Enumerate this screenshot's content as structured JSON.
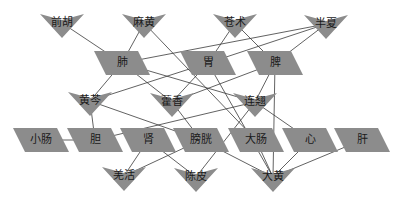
{
  "diagram": {
    "title": "",
    "node_fill": "#8c8c8c",
    "edge_color": "#3a3a3a",
    "herbs": [
      {
        "id": "qianhu",
        "label": "前胡",
        "x": 62,
        "y": 23
      },
      {
        "id": "mahuang",
        "label": "麻黄",
        "x": 144,
        "y": 23
      },
      {
        "id": "cangzhu",
        "label": "苍术",
        "x": 235,
        "y": 23
      },
      {
        "id": "banxia",
        "label": "半夏",
        "x": 326,
        "y": 24
      },
      {
        "id": "huangqin",
        "label": "黄芩",
        "x": 90,
        "y": 101
      },
      {
        "id": "huoxiang",
        "label": "藿香",
        "x": 172,
        "y": 102
      },
      {
        "id": "lianqiao",
        "label": "连翘",
        "x": 255,
        "y": 102
      },
      {
        "id": "qianghuo",
        "label": "羌活",
        "x": 124,
        "y": 176
      },
      {
        "id": "chenpi",
        "label": "陈皮",
        "x": 196,
        "y": 177
      },
      {
        "id": "dahuang",
        "label": "大黄",
        "x": 273,
        "y": 177
      }
    ],
    "organs": [
      {
        "id": "fei",
        "label": "肺",
        "x": 122,
        "y": 63
      },
      {
        "id": "wei",
        "label": "胃",
        "x": 208,
        "y": 63
      },
      {
        "id": "pi",
        "label": "脾",
        "x": 275,
        "y": 63
      },
      {
        "id": "xiaochang",
        "label": "小肠",
        "x": 41,
        "y": 140
      },
      {
        "id": "dan",
        "label": "胆",
        "x": 95,
        "y": 140
      },
      {
        "id": "shen",
        "label": "肾",
        "x": 148,
        "y": 140
      },
      {
        "id": "pangguang",
        "label": "膀胱",
        "x": 201,
        "y": 140
      },
      {
        "id": "dachang",
        "label": "大肠",
        "x": 256,
        "y": 140
      },
      {
        "id": "xin",
        "label": "心",
        "x": 310,
        "y": 140
      },
      {
        "id": "gan",
        "label": "肝",
        "x": 362,
        "y": 140
      }
    ],
    "edges": [
      [
        "qianhu",
        "fei"
      ],
      [
        "mahuang",
        "fei"
      ],
      [
        "mahuang",
        "dachang"
      ],
      [
        "cangzhu",
        "wei"
      ],
      [
        "cangzhu",
        "pi"
      ],
      [
        "banxia",
        "fei"
      ],
      [
        "banxia",
        "wei"
      ],
      [
        "banxia",
        "pi"
      ],
      [
        "fei",
        "huangqin"
      ],
      [
        "fei",
        "huoxiang"
      ],
      [
        "fei",
        "lianqiao"
      ],
      [
        "wei",
        "huangqin"
      ],
      [
        "wei",
        "huoxiang"
      ],
      [
        "wei",
        "dahuang"
      ],
      [
        "pi",
        "huoxiang"
      ],
      [
        "pi",
        "lianqiao"
      ],
      [
        "pi",
        "dahuang"
      ],
      [
        "huangqin",
        "dan"
      ],
      [
        "huangqin",
        "pangguang"
      ],
      [
        "huoxiang",
        "pangguang"
      ],
      [
        "lianqiao",
        "dan"
      ],
      [
        "lianqiao",
        "xin"
      ],
      [
        "lianqiao",
        "chenpi"
      ],
      [
        "xiaochang",
        "dan"
      ],
      [
        "shen",
        "qianghuo"
      ],
      [
        "shen",
        "chenpi"
      ],
      [
        "pangguang",
        "qianghuo"
      ],
      [
        "pangguang",
        "dahuang"
      ],
      [
        "dachang",
        "dahuang"
      ],
      [
        "xin",
        "dahuang"
      ],
      [
        "gan",
        "dahuang"
      ]
    ]
  }
}
